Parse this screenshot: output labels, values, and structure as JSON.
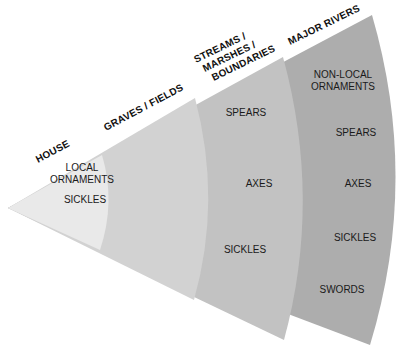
{
  "diagram": {
    "type": "fan-sector-zones",
    "colors": {
      "house": "#e9e9e9",
      "graves": "#d2d2d2",
      "streams": "#c2c2c2",
      "rivers": "#adadad",
      "background": "#ffffff",
      "text": "#1a1a1a"
    },
    "zones": [
      {
        "id": "house",
        "label": "HOUSE",
        "label_lines": [
          "HOUSE"
        ],
        "items": [
          "LOCAL",
          "ORNAMENTS",
          "SICKLES"
        ],
        "item_groups": [
          [
            "LOCAL",
            "ORNAMENTS"
          ],
          [
            "SICKLES"
          ]
        ]
      },
      {
        "id": "graves",
        "label": "GRAVES / FIELDS",
        "label_lines": [
          "GRAVES / FIELDS"
        ],
        "item_groups": []
      },
      {
        "id": "streams",
        "label": "STREAMS / MARSHES / BOUNDARIES",
        "label_lines": [
          "STREAMS /",
          "MARSHES /",
          "BOUNDARIES"
        ],
        "item_groups": [
          [
            "SPEARS"
          ],
          [
            "AXES"
          ],
          [
            "SICKLES"
          ]
        ]
      },
      {
        "id": "rivers",
        "label": "MAJOR RIVERS",
        "label_lines": [
          "MAJOR RIVERS"
        ],
        "item_groups": [
          [
            "NON-LOCAL",
            "ORNAMENTS"
          ],
          [
            "SPEARS"
          ],
          [
            "AXES"
          ],
          [
            "SICKLES"
          ],
          [
            "SWORDS"
          ]
        ]
      }
    ]
  }
}
